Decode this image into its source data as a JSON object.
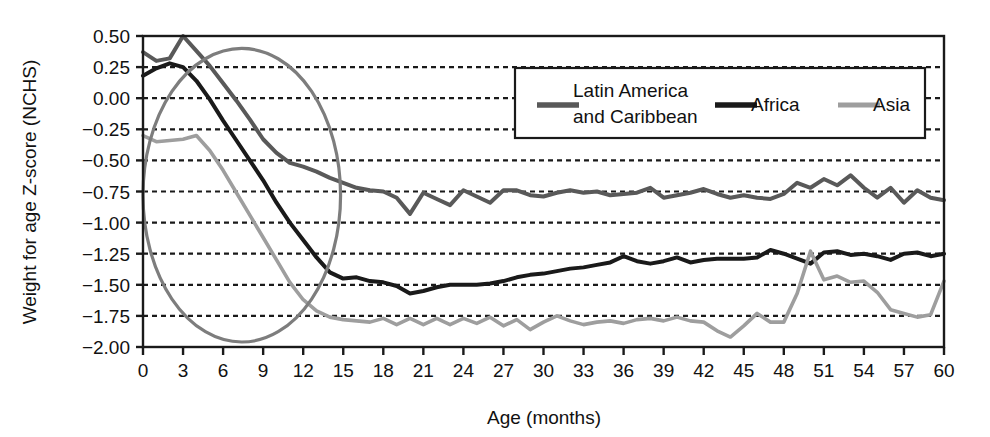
{
  "chart_data": {
    "type": "line",
    "title": "",
    "xlabel": "Age (months)",
    "ylabel": "Weight for age Z-score (NCHS)",
    "xlim": [
      0,
      60
    ],
    "ylim": [
      -2.0,
      0.5
    ],
    "grid": true,
    "legend_position": "top-right-inside",
    "x_ticks": [
      "0",
      "3",
      "6",
      "9",
      "12",
      "15",
      "18",
      "21",
      "24",
      "27",
      "30",
      "33",
      "36",
      "39",
      "42",
      "45",
      "48",
      "51",
      "54",
      "57",
      "60"
    ],
    "x_tick_values": [
      0,
      3,
      6,
      9,
      12,
      15,
      18,
      21,
      24,
      27,
      30,
      33,
      36,
      39,
      42,
      45,
      48,
      51,
      54,
      57,
      60
    ],
    "y_ticks": [
      "0.50",
      "0.25",
      "0.00",
      "-0.25",
      "-0.50",
      "-0.75",
      "-1.00",
      "-1.25",
      "-1.50",
      "-1.75",
      "-2.00"
    ],
    "y_tick_values": [
      0.5,
      0.25,
      0,
      -0.25,
      -0.5,
      -0.75,
      -1.0,
      -1.25,
      -1.5,
      -1.75,
      -2.0
    ],
    "x": [
      0,
      1,
      2,
      3,
      4,
      5,
      6,
      7,
      8,
      9,
      10,
      11,
      12,
      13,
      14,
      15,
      16,
      17,
      18,
      19,
      20,
      21,
      22,
      23,
      24,
      25,
      26,
      27,
      28,
      29,
      30,
      31,
      32,
      33,
      34,
      35,
      36,
      37,
      38,
      39,
      40,
      41,
      42,
      43,
      44,
      45,
      46,
      47,
      48,
      49,
      50,
      51,
      52,
      53,
      54,
      55,
      56,
      57,
      58,
      59,
      60
    ],
    "series": [
      {
        "name": "Latin America and Caribbean",
        "color": "#595959",
        "width": 4.0,
        "values": [
          0.37,
          0.3,
          0.32,
          0.5,
          0.38,
          0.26,
          0.12,
          -0.02,
          -0.17,
          -0.33,
          -0.44,
          -0.52,
          -0.55,
          -0.59,
          -0.64,
          -0.68,
          -0.72,
          -0.74,
          -0.75,
          -0.8,
          -0.93,
          -0.76,
          -0.81,
          -0.86,
          -0.74,
          -0.79,
          -0.84,
          -0.74,
          -0.74,
          -0.78,
          -0.79,
          -0.76,
          -0.74,
          -0.76,
          -0.75,
          -0.78,
          -0.77,
          -0.76,
          -0.72,
          -0.8,
          -0.78,
          -0.76,
          -0.73,
          -0.77,
          -0.8,
          -0.78,
          -0.8,
          -0.81,
          -0.77,
          -0.68,
          -0.72,
          -0.65,
          -0.7,
          -0.62,
          -0.72,
          -0.8,
          -0.72,
          -0.84,
          -0.74,
          -0.8,
          -0.82
        ]
      },
      {
        "name": "Africa",
        "color": "#1a1a1a",
        "width": 4.0,
        "values": [
          0.18,
          0.24,
          0.28,
          0.25,
          0.14,
          -0.01,
          -0.18,
          -0.34,
          -0.5,
          -0.66,
          -0.84,
          -1.0,
          -1.14,
          -1.28,
          -1.4,
          -1.45,
          -1.44,
          -1.47,
          -1.48,
          -1.51,
          -1.57,
          -1.55,
          -1.52,
          -1.5,
          -1.5,
          -1.5,
          -1.49,
          -1.47,
          -1.44,
          -1.42,
          -1.41,
          -1.39,
          -1.37,
          -1.36,
          -1.34,
          -1.32,
          -1.27,
          -1.31,
          -1.33,
          -1.31,
          -1.28,
          -1.32,
          -1.3,
          -1.29,
          -1.29,
          -1.29,
          -1.28,
          -1.22,
          -1.25,
          -1.29,
          -1.33,
          -1.24,
          -1.23,
          -1.26,
          -1.25,
          -1.27,
          -1.3,
          -1.25,
          -1.24,
          -1.27,
          -1.25
        ]
      },
      {
        "name": "Asia",
        "color": "#9e9e9e",
        "width": 3.6,
        "values": [
          -0.3,
          -0.35,
          -0.34,
          -0.33,
          -0.3,
          -0.42,
          -0.58,
          -0.76,
          -0.94,
          -1.12,
          -1.3,
          -1.48,
          -1.62,
          -1.71,
          -1.76,
          -1.78,
          -1.79,
          -1.8,
          -1.77,
          -1.82,
          -1.77,
          -1.82,
          -1.77,
          -1.82,
          -1.77,
          -1.81,
          -1.76,
          -1.83,
          -1.78,
          -1.86,
          -1.8,
          -1.75,
          -1.79,
          -1.82,
          -1.8,
          -1.79,
          -1.81,
          -1.78,
          -1.77,
          -1.79,
          -1.76,
          -1.79,
          -1.8,
          -1.87,
          -1.92,
          -1.83,
          -1.73,
          -1.8,
          -1.8,
          -1.57,
          -1.23,
          -1.46,
          -1.43,
          -1.48,
          -1.47,
          -1.56,
          -1.7,
          -1.73,
          -1.76,
          -1.74,
          -1.47
        ]
      }
    ],
    "annotations": [
      {
        "type": "ellipse",
        "name": "highlight-ellipse",
        "x_center": 7.4,
        "y_center": -0.78,
        "x_radius": 7.4,
        "y_radius": 1.18,
        "color": "#7d7d7d"
      }
    ]
  },
  "legend": {
    "items": [
      {
        "label_line1": "Latin America",
        "label_line2": "and Caribbean"
      },
      {
        "label_line1": "Africa",
        "label_line2": ""
      },
      {
        "label_line1": "Asia",
        "label_line2": ""
      }
    ]
  },
  "axes": {
    "y_title": "Weight for age Z-score (NCHS)",
    "x_title": "Age (months)"
  }
}
